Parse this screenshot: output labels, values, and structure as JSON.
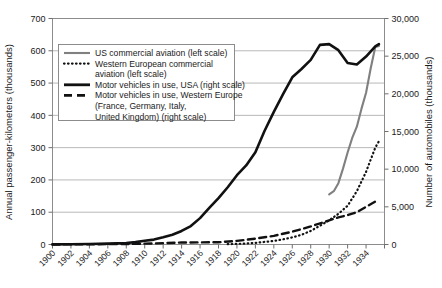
{
  "chart_data": {
    "type": "line",
    "title": "",
    "xlabel": "",
    "ylabel": "Annual passenger-kilometers (thousands)",
    "y2label": "Number of automobiles (thousands)",
    "grid": true,
    "legend_position": "upper-left-inside",
    "xlim": [
      1900,
      1936
    ],
    "ylim": [
      0,
      700
    ],
    "y2lim": [
      0,
      30000
    ],
    "x": [
      1900,
      1902,
      1904,
      1906,
      1908,
      1910,
      1912,
      1914,
      1916,
      1918,
      1920,
      1922,
      1924,
      1926,
      1928,
      1930,
      1932,
      1934
    ],
    "xticklabels": [
      "1900",
      "1902",
      "1904",
      "1906",
      "1908",
      "1910",
      "1912",
      "1914",
      "1916",
      "1918",
      "1920",
      "1922",
      "1924",
      "1926",
      "1928",
      "1930",
      "1932",
      "1934"
    ],
    "yticklabels": [
      "0",
      "100",
      "200",
      "300",
      "400",
      "500",
      "600",
      "700"
    ],
    "yticks": [
      0,
      100,
      200,
      300,
      400,
      500,
      600,
      700
    ],
    "y2ticklabels": [
      "0",
      "5,000",
      "10,000",
      "15,000",
      "20,000",
      "25,000",
      "30,000"
    ],
    "y2ticks": [
      0,
      5000,
      10000,
      15000,
      20000,
      25000,
      30000
    ],
    "series": [
      {
        "name": "US commercial aviation (left scale)",
        "axis": "left",
        "style": "solid-gray",
        "color": "#808080",
        "points": [
          [
            1930.0,
            155
          ],
          [
            1930.5,
            165
          ],
          [
            1931.0,
            190
          ],
          [
            1931.5,
            235
          ],
          [
            1932.0,
            285
          ],
          [
            1932.5,
            330
          ],
          [
            1933.0,
            365
          ],
          [
            1933.5,
            420
          ],
          [
            1934.0,
            470
          ],
          [
            1934.5,
            545
          ],
          [
            1935.0,
            612
          ],
          [
            1935.4,
            615
          ]
        ]
      },
      {
        "name": "Western European commercial aviation (left scale)",
        "axis": "left",
        "style": "dotted-black",
        "color": "#111111",
        "points": [
          [
            1919,
            1
          ],
          [
            1920,
            2
          ],
          [
            1921,
            3
          ],
          [
            1922,
            5
          ],
          [
            1923,
            8
          ],
          [
            1924,
            11
          ],
          [
            1925,
            16
          ],
          [
            1926,
            22
          ],
          [
            1927,
            30
          ],
          [
            1928,
            42
          ],
          [
            1929,
            58
          ],
          [
            1930,
            75
          ],
          [
            1931,
            95
          ],
          [
            1932,
            120
          ],
          [
            1933,
            165
          ],
          [
            1934,
            225
          ],
          [
            1935,
            300
          ],
          [
            1935.4,
            320
          ]
        ]
      },
      {
        "name": "Motor vehicles in use, USA (right scale)",
        "axis": "right",
        "style": "solid-black-thick",
        "color": "#111111",
        "points": [
          [
            1900,
            10
          ],
          [
            1902,
            30
          ],
          [
            1904,
            60
          ],
          [
            1906,
            110
          ],
          [
            1908,
            200
          ],
          [
            1909,
            320
          ],
          [
            1910,
            500
          ],
          [
            1911,
            650
          ],
          [
            1912,
            950
          ],
          [
            1913,
            1300
          ],
          [
            1914,
            1800
          ],
          [
            1915,
            2450
          ],
          [
            1916,
            3500
          ],
          [
            1917,
            4850
          ],
          [
            1918,
            6150
          ],
          [
            1919,
            7600
          ],
          [
            1920,
            9200
          ],
          [
            1921,
            10500
          ],
          [
            1922,
            12250
          ],
          [
            1923,
            15100
          ],
          [
            1924,
            17600
          ],
          [
            1925,
            19950
          ],
          [
            1926,
            22200
          ],
          [
            1927,
            23300
          ],
          [
            1928,
            24500
          ],
          [
            1929,
            26500
          ],
          [
            1930,
            26600
          ],
          [
            1931,
            25800
          ],
          [
            1932,
            24100
          ],
          [
            1933,
            23900
          ],
          [
            1934,
            24950
          ],
          [
            1935,
            26300
          ],
          [
            1935.4,
            26600
          ]
        ]
      },
      {
        "name": "Motor vehicles in use, Western Europe (France, Germany, Italy, United Kingdom) (right scale)",
        "axis": "right",
        "style": "dashed-black",
        "color": "#111111",
        "points": [
          [
            1900,
            5
          ],
          [
            1904,
            25
          ],
          [
            1908,
            70
          ],
          [
            1910,
            110
          ],
          [
            1912,
            180
          ],
          [
            1914,
            260
          ],
          [
            1916,
            280
          ],
          [
            1918,
            300
          ],
          [
            1920,
            480
          ],
          [
            1922,
            780
          ],
          [
            1924,
            1150
          ],
          [
            1926,
            1700
          ],
          [
            1928,
            2400
          ],
          [
            1930,
            3200
          ],
          [
            1931,
            3600
          ],
          [
            1932,
            3900
          ],
          [
            1933,
            4300
          ],
          [
            1934,
            5000
          ],
          [
            1935,
            5700
          ],
          [
            1935.4,
            5900
          ]
        ]
      }
    ],
    "legend": [
      {
        "label": "US commercial aviation (left scale)",
        "style": "solid-gray"
      },
      {
        "label": "Western European commercial",
        "style": "dotted-black"
      },
      {
        "label": "aviation (left scale)",
        "style": "none"
      },
      {
        "label": "Motor vehicles in use, USA (right scale)",
        "style": "solid-black-thick"
      },
      {
        "label": "Motor vehicles in use, Western Europe",
        "style": "dashed-black"
      },
      {
        "label": "(France, Germany, Italy,",
        "style": "none"
      },
      {
        "label": "United Kingdom) (right scale)",
        "style": "none"
      }
    ]
  },
  "colors": {
    "gray_series": "#808080",
    "black_series": "#111111",
    "gridline": "#a6a6a6",
    "frame": "#8c8c8c"
  }
}
